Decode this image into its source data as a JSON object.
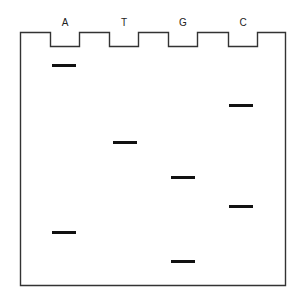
{
  "figure": {
    "type": "gel-electrophoresis-sanger-sequencing",
    "lanes": [
      {
        "label": "A",
        "x": 50
      },
      {
        "label": "T",
        "x": 109
      },
      {
        "label": "G",
        "x": 168
      },
      {
        "label": "C",
        "x": 228
      }
    ],
    "bands": [
      {
        "lane": "A",
        "y": 64
      },
      {
        "lane": "C",
        "y": 104
      },
      {
        "lane": "T",
        "y": 141
      },
      {
        "lane": "G",
        "y": 176
      },
      {
        "lane": "C",
        "y": 205
      },
      {
        "lane": "A",
        "y": 231
      },
      {
        "lane": "G",
        "y": 260
      }
    ],
    "colors": {
      "outline": "#333333",
      "band": "#111111"
    }
  }
}
